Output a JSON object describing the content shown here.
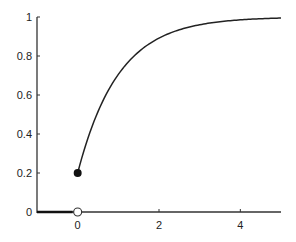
{
  "chart_data": {
    "type": "line",
    "title": "",
    "xlabel": "",
    "ylabel": "",
    "xlim": [
      -1,
      5
    ],
    "ylim": [
      0,
      1
    ],
    "grid": false,
    "legend": null,
    "x_ticks": [
      "0",
      "2",
      "4"
    ],
    "y_ticks": [
      "0",
      "0.2",
      "0.4",
      "0.6",
      "0.8",
      "1"
    ],
    "series": [
      {
        "name": "F(x) for x < 0",
        "x": [
          -1,
          0
        ],
        "y": [
          0,
          0
        ]
      },
      {
        "name": "F(x) = 1 - 0.8 e^{-x} for x >= 0",
        "x": [
          0,
          0.5,
          1,
          1.5,
          2,
          2.5,
          3,
          3.5,
          4,
          4.5,
          5
        ],
        "y": [
          0.2,
          0.51,
          0.71,
          0.82,
          0.89,
          0.93,
          0.96,
          0.98,
          0.99,
          0.99,
          0.99
        ]
      }
    ],
    "annotations": [
      {
        "type": "filled-point",
        "x": 0,
        "y": 0.2
      },
      {
        "type": "open-point",
        "x": 0,
        "y": 0
      }
    ]
  }
}
